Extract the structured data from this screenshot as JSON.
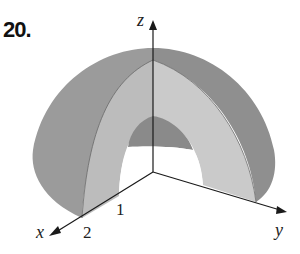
{
  "problem": {
    "number": "20."
  },
  "axes": {
    "x_label": "x",
    "y_label": "y",
    "z_label": "z"
  },
  "ticks": {
    "x_tick_1": "1",
    "x_tick_2": "2"
  },
  "colors": {
    "outer_shell": "#9a9a9a",
    "outer_shell_right": "#8c8c8c",
    "inner_face": "#c4c4c4",
    "inner_cap": "#8a8a8a",
    "axis": "#1a1a1a",
    "background": "#ffffff"
  }
}
